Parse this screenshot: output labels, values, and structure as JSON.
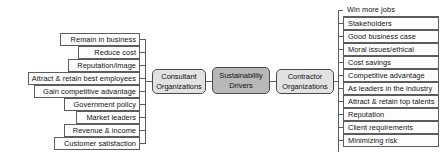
{
  "diagram": {
    "title": "Sustainability Drivers",
    "type": "tree-bracket-diagram",
    "center_node": {
      "line1": "Sustainability",
      "line2": "Drivers",
      "fill": "#b8b8b8"
    },
    "branches": [
      {
        "id": "consultant",
        "node": {
          "line1": "Consultant",
          "line2": "Organizations",
          "fill": "#e2e2e2"
        },
        "side": "left",
        "items": [
          "Remain in business",
          "Reduce cost",
          "Reputation/image",
          "Attract & retain best employees",
          "Gain competitive advantage",
          "Government policy",
          "Market leaders",
          "Revenue & income",
          "Customer satisfaction"
        ]
      },
      {
        "id": "contractor",
        "node": {
          "line1": "Contractor",
          "line2": "Organizations",
          "fill": "#e2e2e2"
        },
        "side": "right",
        "items": [
          "Win more jobs",
          "Stakeholders",
          "Good business case",
          "Moral issues/ethical",
          "Cost savings",
          "Competitive advantage",
          "As leaders in the industry",
          "Attract & retain top talents",
          "Reputation",
          "Client requirements",
          "Minimizing risk"
        ]
      }
    ],
    "colors": {
      "stroke": "#5d5d5d",
      "leaf_fill": "#fdfdfd",
      "hub_fill": "#e2e2e2",
      "center_fill": "#b8b8b8",
      "text": "#121212"
    }
  }
}
